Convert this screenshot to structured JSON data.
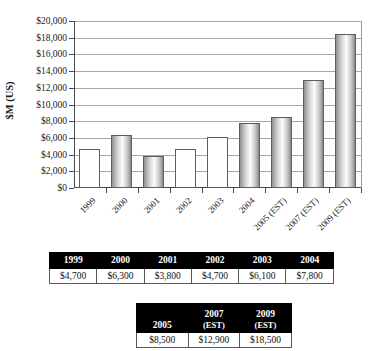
{
  "chart_data": {
    "type": "bar",
    "title": "",
    "subtitle": "",
    "xlabel": "",
    "ylabel": "$M (US)",
    "ylim": [
      0,
      20000
    ],
    "ytick_step": 2000,
    "grid": true,
    "legend": "none",
    "categories": [
      "1999",
      "2000",
      "2001",
      "2002",
      "2003",
      "2004",
      "2005 (EST)",
      "2007 (EST)",
      "2009 (EST)"
    ],
    "values": [
      4700,
      6300,
      3800,
      4700,
      6100,
      7800,
      8500,
      12900,
      18500
    ],
    "ytick_labels": [
      "$0",
      "$2,000",
      "$4,000",
      "$6,000",
      "$8,000",
      "$10,000",
      "$12,000",
      "$14,000",
      "$16,000",
      "$18,000",
      "$20,000"
    ],
    "bar_styles": [
      "plain",
      "grad",
      "grad",
      "plain",
      "plain",
      "grad",
      "grad",
      "grad",
      "grad"
    ],
    "colors": {
      "bar_plain_fill": "#ffffff",
      "bar_gradient_dark": "#8a8a8a",
      "bar_gradient_light": "#ffffff",
      "bar_outline": "#5d5d5d",
      "axis": "#4a4a4a",
      "gridline": "#a8a8a8",
      "text": "#1a1a1a"
    }
  },
  "chart": {
    "y_axis_title": "$M (US)",
    "ticks": [
      {
        "label": "$20,000",
        "value": 20000
      },
      {
        "label": "$18,000",
        "value": 18000
      },
      {
        "label": "$16,000",
        "value": 16000
      },
      {
        "label": "$14,000",
        "value": 14000
      },
      {
        "label": "$12,000",
        "value": 12000
      },
      {
        "label": "$10,000",
        "value": 10000
      },
      {
        "label": "$8,000",
        "value": 8000
      },
      {
        "label": "$6,000",
        "value": 6000
      },
      {
        "label": "$4,000",
        "value": 4000
      },
      {
        "label": "$2,000",
        "value": 2000
      },
      {
        "label": "$0",
        "value": 0
      }
    ],
    "bars": [
      {
        "label": "1999",
        "value": 4700,
        "style": "plain"
      },
      {
        "label": "2000",
        "value": 6300,
        "style": "grad"
      },
      {
        "label": "2001",
        "value": 3800,
        "style": "grad"
      },
      {
        "label": "2002",
        "value": 4700,
        "style": "plain"
      },
      {
        "label": "2003",
        "value": 6100,
        "style": "plain"
      },
      {
        "label": "2004",
        "value": 7800,
        "style": "grad"
      },
      {
        "label": "2005 (EST)",
        "value": 8500,
        "style": "grad"
      },
      {
        "label": "2007 (EST)",
        "value": 12900,
        "style": "grad"
      },
      {
        "label": "2009 (EST)",
        "value": 18500,
        "style": "grad"
      }
    ]
  },
  "table_early": {
    "headers": [
      "1999",
      "2000",
      "2001",
      "2002",
      "2003",
      "2004"
    ],
    "values": [
      "$4,700",
      "$6,300",
      "$3,800",
      "$4,700",
      "$6,100",
      "$7,800"
    ]
  },
  "table_late": {
    "headers": [
      {
        "year": "2005",
        "est": ""
      },
      {
        "year": "2007",
        "est": "(EST)"
      },
      {
        "year": "2009",
        "est": "(EST)"
      }
    ],
    "values": [
      "$8,500",
      "$12,900",
      "$18,500"
    ]
  }
}
